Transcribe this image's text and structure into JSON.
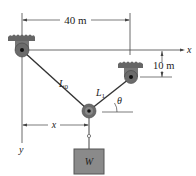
{
  "diagram": {
    "dimensions": {
      "horizontal_span": "40 m",
      "vertical_offset": "10 m"
    },
    "axes": {
      "x_label": "x",
      "y_label": "y",
      "x_dimension_label": "x"
    },
    "cables": {
      "left_segment": "L",
      "left_subscript": "0",
      "right_segment": "L",
      "right_subscript": "1"
    },
    "angle_label": "θ",
    "weight_label": "W",
    "colors": {
      "line": "#333333",
      "bracket": "#555555",
      "weight_fill": "#8a8a8a",
      "weight_border": "#555555",
      "pulley_fill": "#6b6b6b"
    }
  }
}
